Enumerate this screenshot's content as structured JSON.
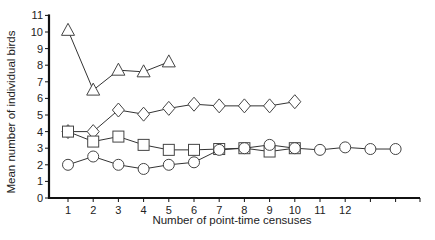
{
  "chart_data": {
    "type": "line",
    "title": "",
    "xlabel": "Number of point-time censuses",
    "ylabel": "Mean number of individual birds",
    "xlim": [
      0,
      15
    ],
    "ylim": [
      0,
      11
    ],
    "x_ticks": [
      1,
      2,
      3,
      4,
      5,
      6,
      7,
      8,
      9,
      10,
      11,
      12,
      13,
      14,
      15
    ],
    "x_tick_labels": [
      "1",
      "2",
      "3",
      "4",
      "5",
      "6",
      "7",
      "8",
      "9",
      "10",
      "11",
      "12",
      "",
      "",
      ""
    ],
    "y_ticks": [
      0,
      1,
      2,
      3,
      4,
      5,
      6,
      7,
      8,
      9,
      10,
      11
    ],
    "y_tick_labels": [
      "0",
      "1",
      "2",
      "3",
      "4",
      "5",
      "6",
      "7",
      "8",
      "9",
      "10",
      "11"
    ],
    "grid": false,
    "legend": null,
    "series": [
      {
        "name": "triangle",
        "marker": "triangle",
        "x": [
          1,
          2,
          3,
          4,
          5
        ],
        "values": [
          10.1,
          6.5,
          7.7,
          7.6,
          8.2
        ]
      },
      {
        "name": "diamond",
        "marker": "diamond",
        "x": [
          1,
          2,
          3,
          4,
          5,
          6,
          7,
          8,
          9,
          10
        ],
        "values": [
          4.0,
          4.0,
          5.3,
          5.05,
          5.4,
          5.65,
          5.55,
          5.55,
          5.55,
          5.8
        ]
      },
      {
        "name": "square",
        "marker": "square",
        "x": [
          1,
          2,
          3,
          4,
          5,
          6,
          7,
          8,
          9,
          10
        ],
        "values": [
          4.0,
          3.4,
          3.7,
          3.2,
          2.9,
          2.9,
          2.95,
          3.0,
          2.8,
          3.0
        ]
      },
      {
        "name": "circle",
        "marker": "circle",
        "x": [
          1,
          2,
          3,
          4,
          5,
          6,
          7,
          8,
          9,
          10,
          11,
          12,
          13,
          14
        ],
        "values": [
          2.0,
          2.5,
          2.0,
          1.75,
          2.0,
          2.15,
          2.9,
          3.0,
          3.2,
          3.0,
          2.9,
          3.05,
          2.95,
          2.95
        ]
      }
    ]
  },
  "layout": {
    "plot_left": 49,
    "plot_right": 420,
    "y_zero_px": 198,
    "y_px_per_unit": 16.6,
    "x_one_px": 68,
    "x_px_per_unit": 25.2
  }
}
